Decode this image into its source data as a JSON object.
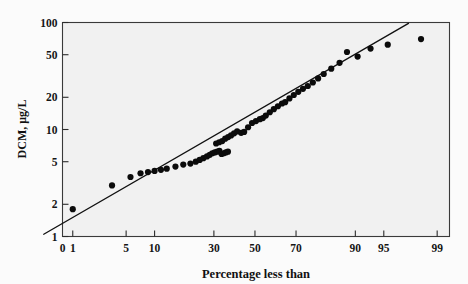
{
  "figure": {
    "background_color": "#fbfbfb",
    "plot_background_color": "#f1f1f1",
    "frame_color": "#3a3a3a",
    "point_color": "#0b0b0b",
    "line_color": "#111111"
  },
  "chart_data": {
    "type": "scatter",
    "title": "",
    "subtitle": "",
    "xlabel": "Percentage less than",
    "ylabel": "DCM, μg/L",
    "x_scale": "probability",
    "y_scale": "log",
    "grid": false,
    "legend": null,
    "xlim": [
      0,
      99
    ],
    "ylim": [
      1,
      100
    ],
    "xticks": [
      0,
      1,
      5,
      10,
      30,
      50,
      70,
      90,
      95,
      99
    ],
    "xticklabels": [
      "0",
      "1",
      "5",
      "10",
      "30",
      "50",
      "70",
      "90",
      "95",
      "99"
    ],
    "yticks": [
      1,
      2,
      5,
      10,
      20,
      50,
      100
    ],
    "yticklabels": [
      "1",
      "2",
      "5",
      "10",
      "20",
      "50",
      "100"
    ],
    "annotations": [],
    "series": [
      {
        "name": "DCM probability plot",
        "marker": "filled-circle",
        "points": [
          {
            "x": 1.0,
            "y": 1.8
          },
          {
            "x": 3.4,
            "y": 3.0
          },
          {
            "x": 5.6,
            "y": 3.6
          },
          {
            "x": 7.2,
            "y": 3.9
          },
          {
            "x": 8.6,
            "y": 4.0
          },
          {
            "x": 10.0,
            "y": 4.1
          },
          {
            "x": 11.5,
            "y": 4.2
          },
          {
            "x": 13.0,
            "y": 4.3
          },
          {
            "x": 15.5,
            "y": 4.5
          },
          {
            "x": 18.0,
            "y": 4.7
          },
          {
            "x": 20.5,
            "y": 4.8
          },
          {
            "x": 22.5,
            "y": 5.0
          },
          {
            "x": 24.0,
            "y": 5.2
          },
          {
            "x": 25.5,
            "y": 5.4
          },
          {
            "x": 27.0,
            "y": 5.6
          },
          {
            "x": 28.2,
            "y": 5.8
          },
          {
            "x": 29.3,
            "y": 6.0
          },
          {
            "x": 30.4,
            "y": 6.1
          },
          {
            "x": 31.5,
            "y": 6.2
          },
          {
            "x": 32.5,
            "y": 6.3
          },
          {
            "x": 33.5,
            "y": 5.9
          },
          {
            "x": 34.5,
            "y": 6.0
          },
          {
            "x": 35.5,
            "y": 6.1
          },
          {
            "x": 36.5,
            "y": 6.2
          },
          {
            "x": 31.0,
            "y": 7.4
          },
          {
            "x": 32.4,
            "y": 7.6
          },
          {
            "x": 33.8,
            "y": 7.8
          },
          {
            "x": 35.2,
            "y": 8.2
          },
          {
            "x": 36.6,
            "y": 8.5
          },
          {
            "x": 38.0,
            "y": 8.8
          },
          {
            "x": 39.5,
            "y": 9.2
          },
          {
            "x": 41.0,
            "y": 9.6
          },
          {
            "x": 43.0,
            "y": 9.3
          },
          {
            "x": 44.5,
            "y": 9.5
          },
          {
            "x": 46.5,
            "y": 10.5
          },
          {
            "x": 48.5,
            "y": 11.5
          },
          {
            "x": 50.5,
            "y": 12.0
          },
          {
            "x": 52.5,
            "y": 12.5
          },
          {
            "x": 54.0,
            "y": 12.8
          },
          {
            "x": 55.5,
            "y": 13.5
          },
          {
            "x": 57.5,
            "y": 14.5
          },
          {
            "x": 59.5,
            "y": 15.5
          },
          {
            "x": 61.5,
            "y": 16.5
          },
          {
            "x": 63.5,
            "y": 17.5
          },
          {
            "x": 65.0,
            "y": 18.0
          },
          {
            "x": 67.0,
            "y": 19.5
          },
          {
            "x": 69.0,
            "y": 21.0
          },
          {
            "x": 71.0,
            "y": 22.5
          },
          {
            "x": 73.0,
            "y": 24.0
          },
          {
            "x": 75.0,
            "y": 25.5
          },
          {
            "x": 77.0,
            "y": 27.5
          },
          {
            "x": 79.0,
            "y": 30.0
          },
          {
            "x": 81.0,
            "y": 33.0
          },
          {
            "x": 83.5,
            "y": 37.0
          },
          {
            "x": 86.0,
            "y": 42.0
          },
          {
            "x": 88.0,
            "y": 53.0
          },
          {
            "x": 90.5,
            "y": 48.0
          },
          {
            "x": 93.0,
            "y": 57.0
          },
          {
            "x": 95.5,
            "y": 62.0
          },
          {
            "x": 98.3,
            "y": 70.0
          }
        ]
      }
    ],
    "fit_line": {
      "name": "lognormal fit line",
      "start": {
        "x": 0.35,
        "y": 1.05
      },
      "end": {
        "x": 97.5,
        "y": 98.0
      }
    }
  }
}
